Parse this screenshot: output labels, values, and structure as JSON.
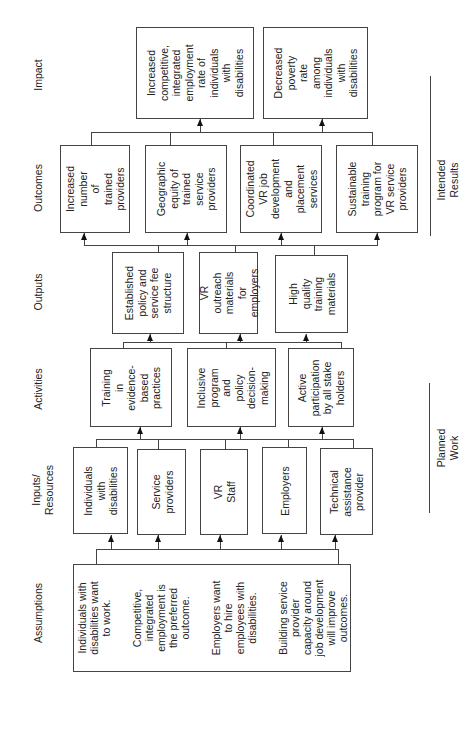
{
  "headers": {
    "impact": "Impact",
    "outcomes": "Outcomes",
    "outputs": "Outputs",
    "activities": "Activities",
    "inputs": "Inputs/\nResources",
    "assumptions": "Assumptions"
  },
  "side_labels": {
    "intended_results": "Intended Results",
    "planned_work": "Planned Work"
  },
  "impact": [
    "Increased\ncompetitive,\nintegrated\nemployment\nrate of\nindividuals\nwith\ndisabilities",
    "Decreased\npoverty rate\namong\nindividuals\nwith\ndisabilities"
  ],
  "outcomes": [
    "Increased\nnumber of\ntrained\nproviders",
    "Geographic\nequity of\ntrained\nservice\nproviders",
    "Coordinated\nVR job\ndevelopment\nand placement\nservices",
    "Sustainable\ntraining\nprogram for\nVR service\nproviders"
  ],
  "outputs": [
    "Established\npolicy and\nservice fee\nstructure",
    "VR outreach\nmaterials for\nemployers",
    "High\nquality\ntraining\nmaterials"
  ],
  "activities": [
    "Training\nin\nevidence-\nbased\npractices",
    "Inclusive\nprogram\nand\npolicy\ndecision-\nmaking",
    "Active\nparticipation\nby all stake\nholders"
  ],
  "inputs": [
    "Individuals\nwith\ndisabilities",
    "Service\nproviders",
    "VR Staff",
    "Employers",
    "Technical\nassistance\nprovider"
  ],
  "assumptions": [
    "Individuals with\ndisabilities want\nto work.",
    "Competitive,\nintegrated\nemployment is\nthe preferred\noutcome.",
    "Employers want\nto hire\nemployees with\ndisabilities.",
    "Building service\nprovider\ncapacity around\njob development\nwill improve\noutcomes."
  ]
}
